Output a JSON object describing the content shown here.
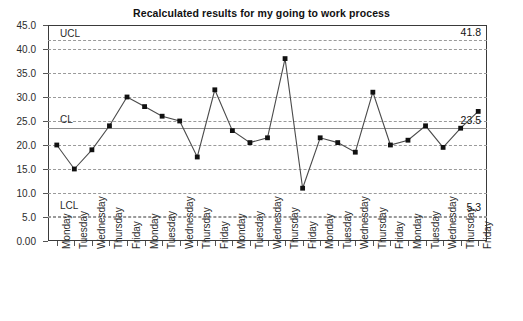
{
  "chart_data": {
    "type": "line",
    "title": "Recalculated results for my going to work process",
    "xlabel": "",
    "ylabel": "",
    "ylim": [
      0,
      45
    ],
    "grid": true,
    "legend": "none",
    "categories": [
      "Monday",
      "Tuesday",
      "Wednesday",
      "Thursday",
      "Friday",
      "Monday",
      "Tuesday",
      "Wednesday",
      "Thursday",
      "Friday",
      "Monday",
      "Tuesday",
      "Wednesday",
      "Thursday",
      "Friday",
      "Monday",
      "Tuesday",
      "Wednesday",
      "Thursday",
      "Friday",
      "Monday",
      "Tuesday",
      "Wednesday",
      "Thursday",
      "Friday"
    ],
    "values": [
      20.0,
      15.0,
      19.0,
      24.0,
      30.0,
      28.0,
      26.0,
      25.0,
      17.5,
      31.5,
      23.0,
      20.5,
      21.5,
      38.0,
      11.0,
      21.5,
      20.5,
      18.5,
      31.0,
      20.0,
      21.0,
      24.0,
      19.5,
      23.5,
      27.0
    ],
    "ytick_labels": [
      "45.0",
      "40.0",
      "35.0",
      "30.0",
      "25.0",
      "20.0",
      "15.0",
      "10.0",
      "5.0",
      "0.00"
    ],
    "ytick_values": [
      45,
      40,
      35,
      30,
      25,
      20,
      15,
      10,
      5,
      0
    ],
    "control_limits": {
      "ucl": {
        "label": "UCL",
        "value": 41.8,
        "value_label": "41.8"
      },
      "cl": {
        "label": "CL",
        "value": 23.5,
        "value_label": "23.5"
      },
      "lcl": {
        "label": "LCL",
        "value": 5.3,
        "value_label": "5.3"
      }
    },
    "colors": {
      "series_line": "#4a4a4a",
      "marker": "#111111",
      "gridline": "#9a9a9a",
      "center_line": "#8d8d8d",
      "axis": "#3a3a3a",
      "text": "#1a1a1a"
    }
  }
}
